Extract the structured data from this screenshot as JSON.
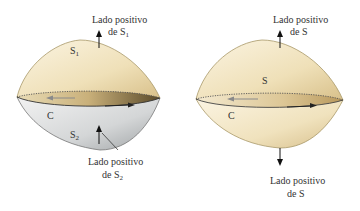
{
  "left_figure": {
    "top_surface_label": "S",
    "top_surface_sub": "1",
    "bottom_surface_label": "S",
    "bottom_surface_sub": "2",
    "curve_label": "C",
    "top_caption_line1": "Lado positivo",
    "top_caption_line2": "de S",
    "top_caption_sub": "1",
    "bottom_caption_line1": "Lado positivo",
    "bottom_caption_line2": "de S",
    "bottom_caption_sub": "2"
  },
  "right_figure": {
    "surface_label": "S",
    "curve_label": "C",
    "top_caption_line1": "Lado positivo",
    "top_caption_line2": "de S",
    "bottom_caption_line1": "Lado positivo",
    "bottom_caption_line2": "de S"
  },
  "colors": {
    "cream": "#f3e7c6",
    "gold": "#cdb27a",
    "gray": "#c9cbcc",
    "outline": "#8a7a52"
  }
}
